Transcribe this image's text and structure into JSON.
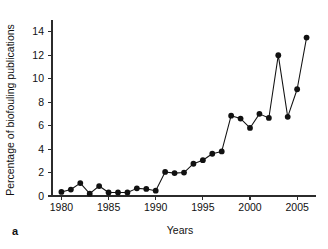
{
  "figure": {
    "panel_label": "a",
    "background_color": "#ffffff",
    "axis_color": "#2b2b2b",
    "series_color": "#111111"
  },
  "chart_data": {
    "type": "line",
    "title": "",
    "subtitle": "",
    "xlabel": "Years",
    "ylabel": "Percentage of biofouling publications",
    "xlim": [
      1979,
      2007
    ],
    "ylim": [
      0,
      15
    ],
    "grid": false,
    "legend": false,
    "legend_position": "none",
    "marker": "filled-circle",
    "xticks": [
      1980,
      1985,
      1990,
      1995,
      2000,
      2005
    ],
    "xticklabels": [
      "1980",
      "1985",
      "1990",
      "1995",
      "2000",
      "2005"
    ],
    "yticks": [
      0,
      2,
      4,
      6,
      8,
      10,
      12,
      14
    ],
    "yticklabels": [
      "0",
      "2",
      "4",
      "6",
      "8",
      "10",
      "12",
      "14"
    ],
    "x": [
      1980,
      1981,
      1982,
      1983,
      1984,
      1985,
      1986,
      1987,
      1988,
      1989,
      1990,
      1991,
      1992,
      1993,
      1994,
      1995,
      1996,
      1997,
      1998,
      1999,
      2000,
      2001,
      2002,
      2003,
      2004,
      2005,
      2006
    ],
    "values": [
      0.35,
      0.55,
      1.1,
      0.2,
      0.85,
      0.3,
      0.3,
      0.3,
      0.65,
      0.6,
      0.45,
      2.05,
      1.95,
      2.0,
      2.75,
      3.05,
      3.6,
      3.8,
      6.85,
      6.6,
      5.8,
      7.0,
      6.65,
      12.0,
      6.75,
      9.1,
      13.5
    ],
    "series": [
      {
        "name": "Percentage of biofouling publications",
        "values": [
          0.35,
          0.55,
          1.1,
          0.2,
          0.85,
          0.3,
          0.3,
          0.3,
          0.65,
          0.6,
          0.45,
          2.05,
          1.95,
          2.0,
          2.75,
          3.05,
          3.6,
          3.8,
          6.85,
          6.6,
          5.8,
          7.0,
          6.65,
          12.0,
          6.75,
          9.1,
          13.5
        ]
      }
    ]
  }
}
